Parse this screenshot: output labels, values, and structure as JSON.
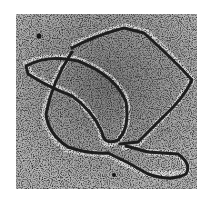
{
  "image": {
    "subject": "electron micrograph of looped DNA strands",
    "alt": "Grainy grayscale micrograph showing two overlapping closed DNA loops with a tail"
  }
}
